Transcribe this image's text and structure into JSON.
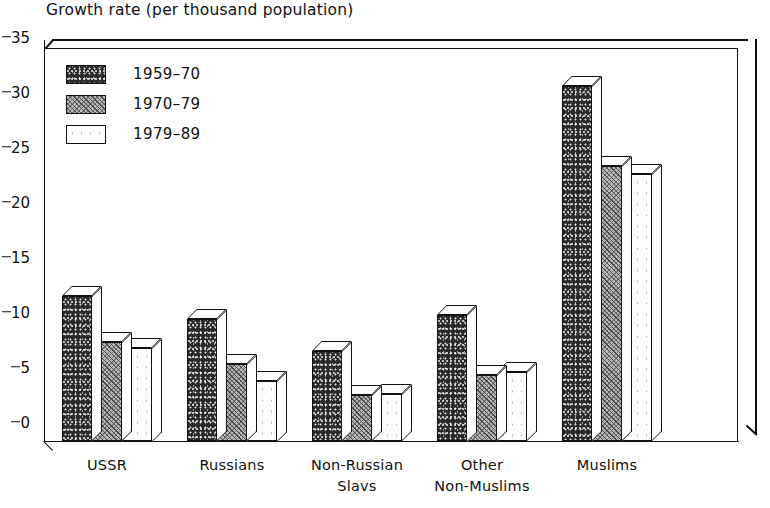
{
  "chart_data": {
    "type": "bar",
    "title": "Growth rate (per thousand population)",
    "xlabel": "",
    "ylabel": "",
    "ylim": [
      0,
      35
    ],
    "yticks": [
      0,
      5,
      10,
      15,
      20,
      25,
      30,
      35
    ],
    "grid": false,
    "legend_position": "top-left",
    "style": "3d-grouped-bars",
    "categories": [
      "USSR",
      "Russians",
      "Non-Russian\nSlavs",
      "Other\nNon-Muslims",
      "Muslims"
    ],
    "series": [
      {
        "name": "1959–70",
        "fill": "dark-speckle",
        "color": "#2a2a2a",
        "values": [
          13.2,
          11.1,
          8.2,
          11.5,
          32.3
        ]
      },
      {
        "name": "1970–79",
        "fill": "gray-hatch",
        "color": "#b9b9b9",
        "values": [
          9.0,
          7.0,
          4.2,
          6.0,
          25.0
        ]
      },
      {
        "name": "1979–89",
        "fill": "white-stipple",
        "color": "#fdfdfd",
        "values": [
          8.5,
          5.5,
          4.3,
          6.3,
          24.3
        ]
      }
    ]
  },
  "colors": {
    "ink": "#111111",
    "paper": "#ffffff"
  }
}
